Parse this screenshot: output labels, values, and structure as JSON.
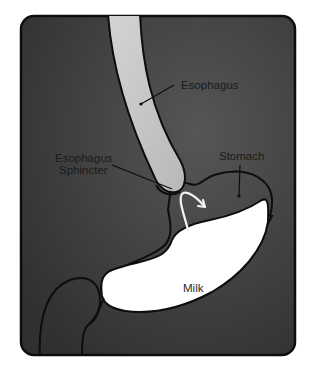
{
  "diagram": {
    "labels": {
      "esophagus": "Esophagus",
      "sphincter_line1": "Esophagus",
      "sphincter_line2": "Sphincter",
      "stomach": "Stomach",
      "milk": "Milk"
    },
    "colors": {
      "background": "#ffffff",
      "panel_dark": "#3a3a3a",
      "panel_light": "#4a4a4a",
      "outline": "#0d0d0d",
      "esophagus_fill": "#c9c9c9",
      "milk_fill": "#ffffff",
      "arrow": "#f2f2f2"
    },
    "annotations": {
      "arrow": "reflux-direction-arrow"
    }
  }
}
